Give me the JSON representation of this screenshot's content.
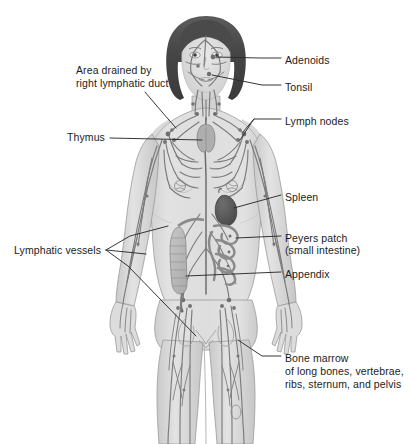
{
  "diagram": {
    "background_color": "#ffffff",
    "palette": {
      "hair": "#4a4a4a",
      "hair_highlight": "#6e6e6e",
      "skin": "#d9d9d9",
      "skin_shadow": "#c2c2c2",
      "skin_light": "#e6e6e6",
      "vessel": "#7a7a7a",
      "vessel_dark": "#5f5f5f",
      "organ": "#b3b3b3",
      "spleen": "#5a5a5a",
      "outline": "#8c8c8c",
      "leader_line": "#2b2b2b",
      "text": "#1b1b1b"
    }
  },
  "labels": {
    "adenoids": {
      "text": "Adenoids",
      "side": "right",
      "x": 285,
      "y": 61
    },
    "tonsil": {
      "text": "Tonsil",
      "side": "right",
      "x": 285,
      "y": 88
    },
    "area_drained_line1": {
      "text": "Area drained by",
      "side": "left",
      "x": 76,
      "y": 71
    },
    "area_drained_line2": {
      "text": "right lymphatic duct",
      "side": "left",
      "x": 76,
      "y": 84
    },
    "lymph_nodes": {
      "text": "Lymph nodes",
      "side": "right",
      "x": 285,
      "y": 122
    },
    "thymus": {
      "text": "Thymus",
      "side": "left",
      "x": 67,
      "y": 137
    },
    "spleen": {
      "text": "Spleen",
      "side": "right",
      "x": 285,
      "y": 198
    },
    "peyers_patch_line1": {
      "text": "Peyers patch",
      "side": "right",
      "x": 285,
      "y": 239
    },
    "peyers_patch_line2": {
      "text": "(small intestine)",
      "side": "right",
      "x": 285,
      "y": 251
    },
    "appendix": {
      "text": "Appendix",
      "side": "right",
      "x": 285,
      "y": 275
    },
    "lymphatic_vessels": {
      "text": "Lymphatic vessels",
      "side": "left",
      "x": 14,
      "y": 250
    },
    "bone_marrow_line1": {
      "text": "Bone marrow",
      "side": "right",
      "x": 285,
      "y": 359
    },
    "bone_marrow_line2": {
      "text": "of long bones, vertebrae,",
      "side": "right",
      "x": 285,
      "y": 372
    },
    "bone_marrow_line3": {
      "text": "ribs, sternum, and pelvis",
      "side": "right",
      "x": 285,
      "y": 385
    }
  },
  "anatomy_parts": [
    "adenoids",
    "tonsil",
    "lymph-nodes",
    "thymus",
    "spleen",
    "peyers-patch",
    "appendix",
    "lymphatic-vessels",
    "bone-marrow",
    "right-lymphatic-duct-drainage-area"
  ]
}
